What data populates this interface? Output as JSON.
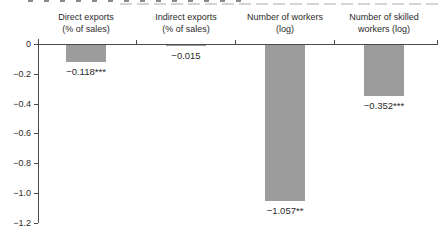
{
  "figure": {
    "background": "#ffffff",
    "bar_color": "#9c9c9c",
    "axis_color": "#4a4a4a",
    "text_color": "#2b2b2b"
  },
  "chart_data": {
    "type": "bar",
    "title": "",
    "orientation": "vertical",
    "categories": [
      "Direct exports (% of sales)",
      "Indirect exports (% of sales)",
      "Number of workers (log)",
      "Number of skilled workers (log)"
    ],
    "category_lines": [
      [
        "Direct exports",
        "(% of sales)"
      ],
      [
        "Indirect exports",
        "(% of sales)"
      ],
      [
        "Number of workers",
        "(log)"
      ],
      [
        "Number of skilled",
        "workers (log)"
      ]
    ],
    "values": [
      -0.118,
      -0.015,
      -1.057,
      -0.352
    ],
    "value_labels": [
      "−0.118***",
      "−0.015",
      "−1.057**",
      "−0.352***"
    ],
    "ylim": [
      -1.2,
      0
    ],
    "yticks": [
      0,
      -0.2,
      -0.4,
      -0.6,
      -0.8,
      -1.0,
      -1.2
    ],
    "ytick_labels": [
      "0",
      "−0.2",
      "−0.4",
      "−0.6",
      "−0.8",
      "−1.0",
      "−1.2"
    ],
    "xlabel": "",
    "ylabel": "",
    "grid": false,
    "legend": null
  }
}
